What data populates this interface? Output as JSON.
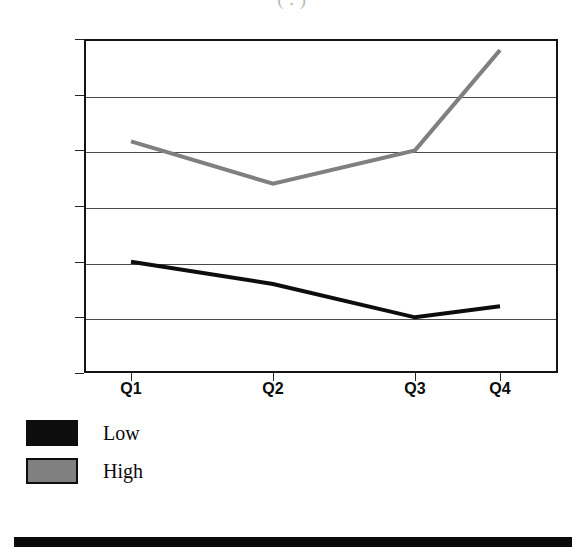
{
  "figure": {
    "title_remnant": "(  .  )",
    "background_color": "#ffffff"
  },
  "chart_data": {
    "type": "line",
    "title": "",
    "subtitle": "",
    "xlabel": "",
    "ylabel": "",
    "categories": [
      "Q1",
      "Q2",
      "Q3",
      "Q4"
    ],
    "series": [
      {
        "name": "Low",
        "color": "#0d0d0d",
        "values": [
          40,
          38,
          35,
          36
        ]
      },
      {
        "name": "High",
        "color": "#808080",
        "values": [
          50.8,
          47,
          50,
          59
        ]
      }
    ],
    "ylim": [
      30,
      60
    ],
    "yticks": [
      30,
      35,
      40,
      45,
      50,
      55,
      60
    ],
    "ytick_labels": [
      "30",
      "35",
      "40",
      "45",
      "50",
      "55",
      "60"
    ],
    "grid": true,
    "grid_axis": "y",
    "legend_position": "below-left",
    "line_width": 4
  },
  "legend": {
    "entries": [
      {
        "label": "Low",
        "color": "#0d0d0d"
      },
      {
        "label": "High",
        "color": "#808080"
      }
    ]
  },
  "footer": {
    "rule_color": "#0b0b0b"
  }
}
